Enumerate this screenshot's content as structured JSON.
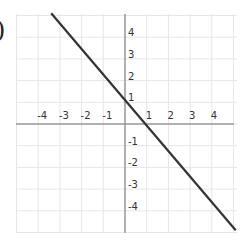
{
  "label_prefix": ")",
  "chart_data": {
    "type": "line",
    "title": "",
    "xlabel": "",
    "ylabel": "",
    "xlim": [
      -5,
      5
    ],
    "ylim": [
      -5,
      5
    ],
    "grid": true,
    "x_ticks": [
      "-4",
      "-3",
      "-2",
      "-1",
      "1",
      "2",
      "3",
      "4"
    ],
    "y_ticks": [
      "4",
      "3",
      "2",
      "1",
      "-1",
      "-2",
      "-3",
      "-4"
    ],
    "series": [
      {
        "name": "line",
        "x": [
          -3.4,
          5.1
        ],
        "y": [
          5.1,
          -4.9
        ],
        "color": "#333333",
        "note": "straight line through approximately (0, 1) and (0.9, 0)"
      }
    ]
  }
}
